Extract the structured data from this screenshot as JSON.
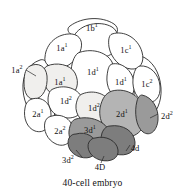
{
  "figure": {
    "caption": "40-cell embryo",
    "colors": {
      "outline": "#2b2b2b",
      "cell_white": "#ffffff",
      "cell_stipple": "#f0efed",
      "cell_mid_gray": "#b4b4b4",
      "cell_dark_gray": "#9a9a9a",
      "cell_darker_gray": "#7d7d7d",
      "text": "#111111",
      "background": "#ffffff"
    }
  },
  "cells": [
    {
      "id": "1b1",
      "base": "1b",
      "exponent": "1",
      "shade": "white",
      "x": 92,
      "y": 28
    },
    {
      "id": "1a1t",
      "base": "1a",
      "exponent": "1",
      "shade": "white",
      "x": 62,
      "y": 48
    },
    {
      "id": "1c1",
      "base": "1c",
      "exponent": "1",
      "shade": "white",
      "x": 126,
      "y": 50
    },
    {
      "id": "1d1t",
      "base": "1d",
      "exponent": "1",
      "shade": "white",
      "x": 93,
      "y": 70
    },
    {
      "id": "1a1b",
      "base": "1a",
      "exponent": "1",
      "shade": "stipple",
      "x": 60,
      "y": 72
    },
    {
      "id": "1a2",
      "base": "1a",
      "exponent": "2",
      "shade": "stipple",
      "x": 17,
      "y": 70
    },
    {
      "id": "1d1b",
      "base": "1d",
      "exponent": "1",
      "shade": "white",
      "x": 124,
      "y": 79
    },
    {
      "id": "1c2",
      "base": "1c",
      "exponent": "2",
      "shade": "white",
      "x": 152,
      "y": 82
    },
    {
      "id": "1d2l",
      "base": "1d",
      "exponent": "2",
      "shade": "white",
      "x": 68,
      "y": 99
    },
    {
      "id": "1d2r",
      "base": "1d",
      "exponent": "2",
      "shade": "stipple",
      "x": 96,
      "y": 105
    },
    {
      "id": "2a1",
      "base": "2a",
      "exponent": "1",
      "shade": "white",
      "x": 40,
      "y": 112
    },
    {
      "id": "2d1",
      "base": "2d",
      "exponent": "1",
      "shade": "mid",
      "x": 124,
      "y": 113
    },
    {
      "id": "2a2",
      "base": "2a",
      "exponent": "2",
      "shade": "white",
      "x": 62,
      "y": 130
    },
    {
      "id": "3d1",
      "base": "3d",
      "exponent": "1",
      "shade": "dark",
      "x": 91,
      "y": 129
    },
    {
      "id": "2d2",
      "base": "2d",
      "exponent": "2",
      "shade": "dark",
      "x": 164,
      "y": 116
    },
    {
      "id": "3d2",
      "base": "3d",
      "exponent": "2",
      "shade": "darker",
      "x": 70,
      "y": 155
    },
    {
      "id": "4D",
      "base": "4D",
      "exponent": "",
      "shade": "darker",
      "x": 100,
      "y": 160
    },
    {
      "id": "4d",
      "base": "4d",
      "exponent": "",
      "shade": "darker",
      "x": 134,
      "y": 146
    }
  ],
  "labels": {
    "l_1b1": "1b",
    "l_1b1_sup": "1",
    "l_1a1t": "1a",
    "l_1a1t_sup": "1",
    "l_1c1": "1c",
    "l_1c1_sup": "1",
    "l_1d1t": "1d",
    "l_1d1t_sup": "1",
    "l_1a1b": "1a",
    "l_1a1b_sup": "1",
    "l_1a2": "1a",
    "l_1a2_sup": "2",
    "l_1d1b": "1d",
    "l_1d1b_sup": "1",
    "l_1c2": "1c",
    "l_1c2_sup": "2",
    "l_1d2l": "1d",
    "l_1d2l_sup": "2",
    "l_1d2r": "1d",
    "l_1d2r_sup": "2",
    "l_2a1": "2a",
    "l_2a1_sup": "1",
    "l_2d1": "2d",
    "l_2d1_sup": "1",
    "l_2a2": "2a",
    "l_2a2_sup": "2",
    "l_3d1": "3d",
    "l_3d1_sup": "1",
    "l_2d2": "2d",
    "l_2d2_sup": "2",
    "l_3d2": "3d",
    "l_3d2_sup": "2",
    "l_4D": "4D",
    "l_4d": "4d"
  }
}
